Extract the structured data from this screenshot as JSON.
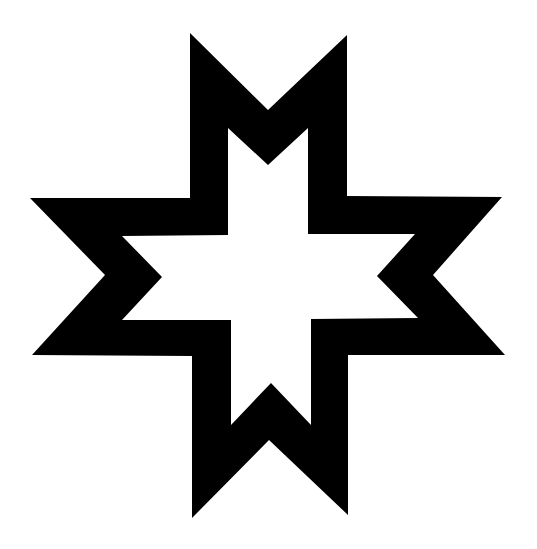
{
  "figure": {
    "description": "Eight-pointed star symbol outlined in black on white",
    "icon": "eight-pointed-star-icon",
    "colors": {
      "stroke_fill": "#000000",
      "background": "#ffffff"
    }
  }
}
